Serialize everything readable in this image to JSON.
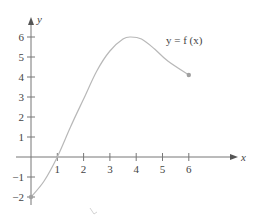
{
  "chart_data": {
    "type": "line",
    "title": "",
    "xlabel": "x",
    "ylabel": "y",
    "curve_label": "y = f (x)",
    "xlim": [
      0,
      6
    ],
    "ylim": [
      -2,
      6
    ],
    "x_ticks": [
      1,
      2,
      3,
      4,
      5,
      6
    ],
    "y_ticks": [
      -2,
      -1,
      1,
      2,
      3,
      4,
      5,
      6
    ],
    "grid": false,
    "legend": "none",
    "series": [
      {
        "name": "f(x)",
        "x": [
          0,
          0.5,
          1,
          1.5,
          2,
          2.5,
          3,
          3.5,
          3.8,
          4.2,
          4.7,
          5.2,
          6
        ],
        "values": [
          -2,
          -1.2,
          0,
          1.5,
          2.9,
          4.3,
          5.3,
          5.9,
          6.0,
          5.9,
          5.4,
          4.8,
          4.1
        ]
      }
    ],
    "endpoints": [
      {
        "x": 0,
        "y": -2,
        "style": "closed"
      },
      {
        "x": 6,
        "y": 4.1,
        "style": "closed"
      }
    ],
    "colors": {
      "axis": "#777777",
      "curve": "#b8b8b8",
      "endpoint": "#a0a0a0",
      "text": "#444444"
    }
  }
}
